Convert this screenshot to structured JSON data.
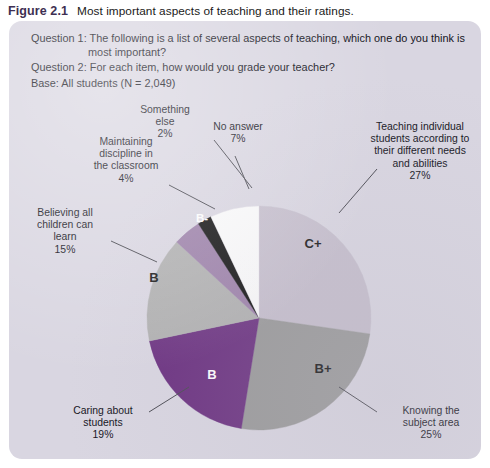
{
  "caption": {
    "figure_label": "Figure 2.1",
    "title": "Most important aspects of teaching and their ratings."
  },
  "questions": {
    "q1_label": "Question 1:",
    "q1_line1": " The following is a list of several aspects of teaching, which one do you think is",
    "q1_line2": "most important?",
    "q2_label": "Question 2:",
    "q2_text": " For each item, how would you grade your teacher?",
    "base": "Base: All students (N = 2,049)"
  },
  "source_note": "",
  "colors": {
    "panel_background": "#d9d6e1",
    "figure_label": "#3e2f52",
    "c_plus": "#c6bfcd",
    "b_plus": "#9a9a9a",
    "b_dark": "#6b3180",
    "b_light": "#b0b0b0",
    "b_minus": "#9b7fa8",
    "something_else": "#0d0d0d",
    "no_answer": "#fbfbfb",
    "leader_line": "#4a4a52"
  },
  "chart_data": {
    "type": "pie",
    "title": "Most important aspects of teaching and their ratings.",
    "unit": "%",
    "total": 99,
    "base_n": 2049,
    "start_angle_deg": 0,
    "direction": "clockwise",
    "legend": "none",
    "grid": false,
    "categories": [
      "Teaching individual students according to their different needs and abilities",
      "Knowing the subject area",
      "Caring about students",
      "Believing all children can learn",
      "Maintaining discipline in the classroom",
      "Something else",
      "No answer"
    ],
    "values": [
      27,
      25,
      19,
      15,
      4,
      2,
      7
    ],
    "slices": [
      {
        "aspect_label": "Teaching individual\nstudents according to\ntheir different needs\nand abilities\n27%",
        "aspect": "Teaching individual students according to their different needs and abilities",
        "value": 27,
        "percent_text": "27%",
        "grade": "C+",
        "color": "#c6bfcd",
        "grade_text_color": "#151515"
      },
      {
        "aspect_label": "Knowing the\nsubject area\n25%",
        "aspect": "Knowing the subject area",
        "value": 25,
        "percent_text": "25%",
        "grade": "B+",
        "color": "#9a9a9a",
        "grade_text_color": "#151515"
      },
      {
        "aspect_label": "Caring about\nstudents\n19%",
        "aspect": "Caring about students",
        "value": 19,
        "percent_text": "19%",
        "grade": "B",
        "color": "#6b3180",
        "grade_text_color": "#ffffff"
      },
      {
        "aspect_label": "Believing all\nchildren can\nlearn\n15%",
        "aspect": "Believing all children can learn",
        "value": 15,
        "percent_text": "15%",
        "grade": "B",
        "color": "#b0b0b0",
        "grade_text_color": "#151515"
      },
      {
        "aspect_label": "Maintaining\ndiscipline in\nthe classroom\n4%",
        "aspect": "Maintaining discipline in the classroom",
        "value": 4,
        "percent_text": "4%",
        "grade": "B-",
        "color": "#9b7fa8",
        "grade_text_color": "#ffffff"
      },
      {
        "aspect_label": "Something\nelse\n2%",
        "aspect": "Something else",
        "value": 2,
        "percent_text": "2%",
        "grade": "",
        "color": "#0d0d0d",
        "grade_text_color": "#ffffff"
      },
      {
        "aspect_label": "No answer\n7%",
        "aspect": "No answer",
        "value": 7,
        "percent_text": "7%",
        "grade": "",
        "color": "#fbfbfb",
        "grade_text_color": "#151515"
      }
    ]
  }
}
